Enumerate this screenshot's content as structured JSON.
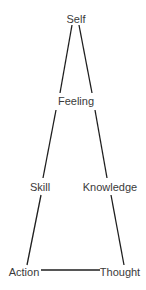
{
  "diagram": {
    "type": "hierarchy-triangle",
    "nodes": {
      "self": {
        "label": "Self",
        "x": 76,
        "y": 19
      },
      "feeling": {
        "label": "Feeling",
        "x": 76,
        "y": 101
      },
      "skill": {
        "label": "Skill",
        "x": 40,
        "y": 187
      },
      "knowledge": {
        "label": "Knowledge",
        "x": 110,
        "y": 187
      },
      "action": {
        "label": "Action",
        "x": 24,
        "y": 272
      },
      "thought": {
        "label": "Thought",
        "x": 120,
        "y": 272
      }
    },
    "edges": [
      {
        "from": "Self",
        "to": "Feeling",
        "side": "left"
      },
      {
        "from": "Self",
        "to": "Feeling",
        "side": "right"
      },
      {
        "from": "Feeling",
        "to": "Skill"
      },
      {
        "from": "Feeling",
        "to": "Knowledge"
      },
      {
        "from": "Skill",
        "to": "Action"
      },
      {
        "from": "Knowledge",
        "to": "Thought"
      },
      {
        "from": "Action",
        "to": "Thought"
      }
    ],
    "colors": {
      "line": "#1e1e1e",
      "text": "#3a3a3a",
      "background": "#ffffff"
    }
  }
}
